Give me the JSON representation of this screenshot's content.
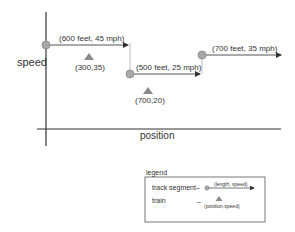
{
  "axes": {
    "y_label": "speed",
    "x_label": "position"
  },
  "segments": [
    {
      "label": "(600 feet, 45 mph)",
      "length_ft": 600,
      "speed_mph": 45
    },
    {
      "label": "(500 feet, 25 mph)",
      "length_ft": 500,
      "speed_mph": 25
    },
    {
      "label": "(700 feet, 35 mph)",
      "length_ft": 700,
      "speed_mph": 35
    }
  ],
  "trains": [
    {
      "label": "(300,35)",
      "position": 300,
      "speed": 35
    },
    {
      "label": "(700,20)",
      "position": 700,
      "speed": 20
    }
  ],
  "legend": {
    "title": "legend",
    "track_segment_label": "track segment",
    "track_segment_dash": "–",
    "track_segment_example": "(length, speed)",
    "train_label": "train",
    "train_dash": "–",
    "train_example": "(position,speed)"
  },
  "colors": {
    "axis": "#333333",
    "segment": "#555555",
    "node_fill": "#a8a8a8",
    "train_fill": "#8a8a8a",
    "connector": "#bbbbbb"
  }
}
